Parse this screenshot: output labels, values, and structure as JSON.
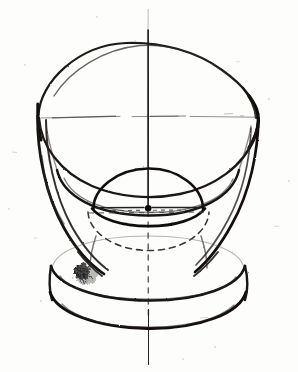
{
  "document": {
    "kind": "freehand-technical-drawing",
    "subject": "goblet / chalice constructed from a cone-bowl, a sphere knop and a disc foot",
    "medium": "pencil and ink on white paper",
    "background_color": "#fdfdfc",
    "ink_color": "#1a1a1a",
    "construction_line_color": "#6e6a66",
    "hidden_line_color": "#3d3a37",
    "canvas": {
      "width": 298,
      "height": 372
    }
  },
  "geometry": {
    "center_axis_x": 148,
    "axis": {
      "name": "vertical-axis-of-revolution",
      "top_y": 8,
      "bottom_y": 364,
      "solid_top_y": 30,
      "solid_bottom_y": 208,
      "dashed_segment": [
        208,
        316
      ],
      "solid_tail": [
        316,
        364
      ]
    },
    "bowl_rim": {
      "name": "bowl-rim-ellipse",
      "center_x": 148,
      "center_y": 117,
      "radius_x": 110,
      "radius_y": 74
    },
    "bowl_horizontal_axis": {
      "y": 117,
      "x_start": 40,
      "x_end": 256
    },
    "bowl_interior_floor": {
      "name": "bowl-inner-floor-arc",
      "center_x": 148,
      "center_y": 170,
      "radius_x": 92,
      "radius_y": 52
    },
    "bowl_wall_left": {
      "top_x": 38,
      "top_y": 118,
      "bottom_x": 96,
      "bottom_y": 268
    },
    "bowl_wall_right": {
      "top_x": 258,
      "top_y": 118,
      "bottom_x": 206,
      "bottom_y": 270
    },
    "knop_sphere": {
      "name": "sphere-knop",
      "center_x": 148,
      "center_y": 208,
      "radius_x": 55,
      "radius_y": 40,
      "equator_y": 208,
      "visible_upper": true,
      "hidden_lower_dashed": true,
      "center_dot_radius": 3.2
    },
    "knop_hidden_ellipse": {
      "center_x": 148,
      "center_y": 232,
      "radius_x": 60,
      "radius_y": 26
    },
    "foot_top_ellipse": {
      "name": "foot-top-ellipse",
      "center_x": 148,
      "center_y": 268,
      "radius_x": 97,
      "radius_y": 34
    },
    "foot_bottom_ellipse": {
      "name": "foot-base-ellipse",
      "center_x": 148,
      "center_y": 296,
      "radius_x": 100,
      "radius_y": 36
    },
    "smudge": {
      "x": 72,
      "y": 262,
      "width": 22,
      "height": 24
    }
  },
  "labels": {
    "title": "Goblet — axis construction study",
    "axis_label": "axis of revolution",
    "rim_label": "bowl rim ellipse",
    "knop_label": "sphere knop",
    "foot_label": "foot disc"
  },
  "strokes": {
    "rim_weight": 2.6,
    "wall_weight": 2.4,
    "foot_weight": 2.6,
    "construction_weight": 0.9,
    "hidden_weight": 1.5,
    "hidden_dash": "6 5"
  }
}
